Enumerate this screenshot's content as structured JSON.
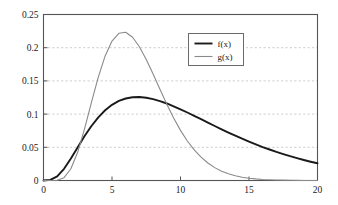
{
  "chart_data": {
    "type": "line",
    "title": "",
    "xlabel": "",
    "ylabel": "",
    "xlim": [
      0,
      20
    ],
    "ylim": [
      0,
      0.25
    ],
    "xticks": [
      0,
      5,
      10,
      15,
      20
    ],
    "yticks": [
      0,
      0.05,
      0.1,
      0.15,
      0.2,
      0.25
    ],
    "xtick_labels": [
      "0",
      "5",
      "10",
      "15",
      "20"
    ],
    "ytick_labels": [
      "0",
      "0.05",
      "0.1",
      "0.15",
      "0.2",
      "0.25"
    ],
    "grid": "horizontal-dashed",
    "legend_position": "top-center-right",
    "frame": "full-box",
    "series": [
      {
        "name": "f(x)",
        "color": "#1a1a1a",
        "width": 1.9,
        "peak_x": 7.0,
        "peak_y": 0.149,
        "x": [
          0,
          0.5,
          1,
          1.5,
          2,
          2.5,
          3,
          3.5,
          4,
          4.5,
          5,
          5.5,
          6,
          6.5,
          7,
          7.5,
          8,
          8.5,
          9,
          9.5,
          10,
          10.5,
          11,
          11.5,
          12,
          12.5,
          13,
          13.5,
          14,
          14.5,
          15,
          15.5,
          16,
          16.5,
          17,
          17.5,
          18,
          18.5,
          19,
          19.5,
          20
        ],
        "y": [
          0,
          0.0009,
          0.0063,
          0.0176,
          0.0331,
          0.0501,
          0.0669,
          0.0821,
          0.0952,
          0.1058,
          0.114,
          0.1198,
          0.1235,
          0.1254,
          0.1257,
          0.1247,
          0.1226,
          0.1196,
          0.116,
          0.1118,
          0.1072,
          0.1024,
          0.0974,
          0.0923,
          0.0872,
          0.0821,
          0.0771,
          0.0722,
          0.0675,
          0.0629,
          0.0586,
          0.0544,
          0.0504,
          0.0467,
          0.0431,
          0.0398,
          0.0366,
          0.0337,
          0.0309,
          0.0283,
          0.0259
        ]
      },
      {
        "name": "g(x)",
        "color": "#8a8a8a",
        "width": 1.1,
        "peak_x": 5.3,
        "peak_y": 0.218,
        "x": [
          0,
          0.5,
          1,
          1.5,
          2,
          2.5,
          3,
          3.5,
          4,
          4.5,
          5,
          5.5,
          6,
          6.5,
          7,
          7.5,
          8,
          8.5,
          9,
          9.5,
          10,
          10.5,
          11,
          11.5,
          12,
          12.5,
          13,
          13.5,
          14,
          14.5,
          15,
          15.5,
          16,
          16.5,
          17,
          17.5,
          18,
          18.5,
          19,
          19.5,
          20
        ],
        "y": [
          0,
          0.0,
          0.0004,
          0.0043,
          0.0177,
          0.0428,
          0.078,
          0.1177,
          0.1558,
          0.1876,
          0.21,
          0.2217,
          0.2232,
          0.2158,
          0.2014,
          0.1823,
          0.1604,
          0.1375,
          0.115,
          0.0941,
          0.0755,
          0.0595,
          0.0461,
          0.0351,
          0.0263,
          0.0194,
          0.0141,
          0.0101,
          0.0072,
          0.005,
          0.0035,
          0.0024,
          0.0016,
          0.0011,
          0.0007,
          0.0005,
          0.0003,
          0.0002,
          0.0001,
          0.0001,
          0.0
        ]
      }
    ],
    "legend_entries": [
      {
        "label": "f(x)",
        "color": "#1a1a1a",
        "width": 1.9
      },
      {
        "label": "g(x)",
        "color": "#8a8a8a",
        "width": 1.1
      }
    ],
    "colors": {
      "axis": "#555555",
      "grid": "#b8b8b8",
      "text": "#1a1a1a",
      "background": "#ffffff",
      "legend_border": "#6a6a6a"
    }
  }
}
